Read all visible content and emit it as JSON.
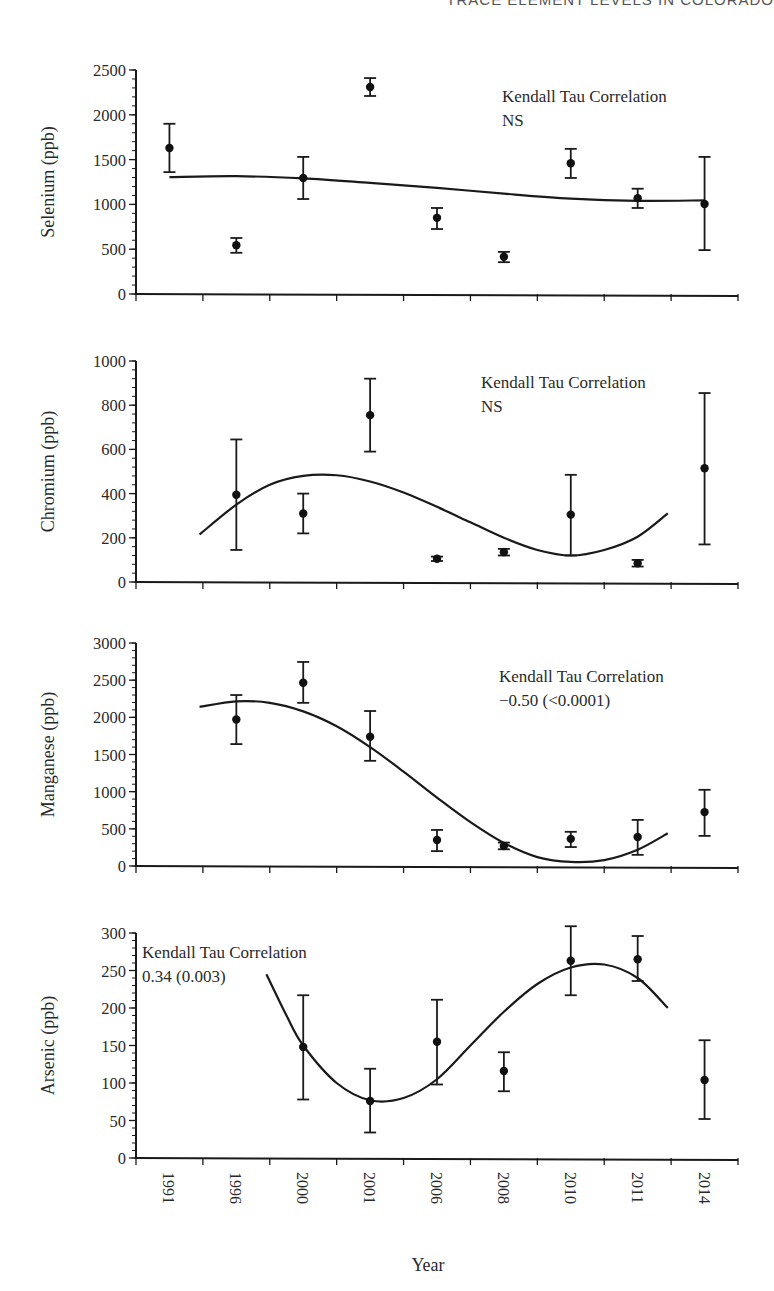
{
  "header": {
    "running_title": "TRACE ELEMENT LEVELS IN COLORADO"
  },
  "figure": {
    "x_axis_title": "Year",
    "x_categories": [
      "1991",
      "1996",
      "2000",
      "2001",
      "2006",
      "2008",
      "2010",
      "2011",
      "2014"
    ]
  },
  "chart_data": [
    {
      "type": "scatter",
      "title": "",
      "xlabel": "Year",
      "ylabel": "Selenium (ppb)",
      "ylim": [
        0,
        2500
      ],
      "yticks": [
        0,
        500,
        1000,
        1500,
        2000,
        2500
      ],
      "categories": [
        "1991",
        "1996",
        "2000",
        "2001",
        "2006",
        "2008",
        "2010",
        "2011",
        "2014"
      ],
      "values": [
        1630,
        545,
        1295,
        2310,
        850,
        415,
        1460,
        1070,
        1005
      ],
      "error_low": [
        1360,
        460,
        1060,
        2210,
        725,
        355,
        1295,
        960,
        490
      ],
      "error_high": [
        1900,
        625,
        1530,
        2410,
        960,
        470,
        1620,
        1175,
        1530
      ],
      "trend_curve": {
        "x_index": [
          0,
          1,
          2,
          3,
          4,
          5,
          6,
          7,
          8
        ],
        "values": [
          1305,
          1315,
          1290,
          1240,
          1185,
          1120,
          1065,
          1040,
          1045
        ]
      },
      "annotation": {
        "line1": "Kendall Tau Correlation",
        "line2": "NS"
      },
      "grid": false,
      "legend": "none"
    },
    {
      "type": "scatter",
      "title": "",
      "xlabel": "Year",
      "ylabel": "Chromium (ppb)",
      "ylim": [
        0,
        1000
      ],
      "yticks": [
        0,
        200,
        400,
        600,
        800,
        1000
      ],
      "categories": [
        "1991",
        "1996",
        "2000",
        "2001",
        "2006",
        "2008",
        "2010",
        "2011",
        "2014"
      ],
      "values": [
        null,
        395,
        310,
        755,
        105,
        135,
        305,
        85,
        515
      ],
      "error_low": [
        null,
        145,
        220,
        590,
        95,
        120,
        120,
        70,
        170
      ],
      "error_high": [
        null,
        645,
        400,
        920,
        115,
        150,
        485,
        100,
        855
      ],
      "trend_curve": {
        "x_index": [
          0.45,
          1,
          1.5,
          2,
          2.5,
          3,
          3.5,
          4,
          4.5,
          5,
          5.5,
          6,
          6.5,
          7,
          7.45
        ],
        "values": [
          215,
          350,
          440,
          480,
          483,
          455,
          405,
          340,
          270,
          200,
          145,
          120,
          145,
          205,
          310
        ]
      },
      "annotation": {
        "line1": "Kendall Tau Correlation",
        "line2": "NS"
      },
      "grid": false,
      "legend": "none"
    },
    {
      "type": "scatter",
      "title": "",
      "xlabel": "Year",
      "ylabel": "Manganese (ppb)",
      "ylim": [
        0,
        3000
      ],
      "yticks": [
        0,
        500,
        1000,
        1500,
        2000,
        2500,
        3000
      ],
      "categories": [
        "1991",
        "1996",
        "2000",
        "2001",
        "2006",
        "2008",
        "2010",
        "2011",
        "2014"
      ],
      "values": [
        null,
        1970,
        2465,
        1740,
        350,
        270,
        365,
        390,
        725
      ],
      "error_low": [
        null,
        1640,
        2195,
        1415,
        200,
        225,
        255,
        150,
        405
      ],
      "error_high": [
        null,
        2300,
        2745,
        2085,
        485,
        315,
        460,
        620,
        1025
      ],
      "trend_curve": {
        "x_index": [
          0.45,
          1,
          1.5,
          2,
          2.5,
          3,
          3.5,
          4,
          4.5,
          5,
          5.5,
          6,
          6.5,
          7,
          7.45
        ],
        "values": [
          2140,
          2215,
          2195,
          2080,
          1880,
          1600,
          1270,
          920,
          590,
          310,
          120,
          55,
          80,
          220,
          440
        ]
      },
      "annotation": {
        "line1": "Kendall Tau Correlation",
        "line2": "−0.50 (<0.0001)"
      },
      "grid": false,
      "legend": "none"
    },
    {
      "type": "scatter",
      "title": "",
      "xlabel": "Year",
      "ylabel": "Arsenic (ppb)",
      "ylim": [
        0,
        300
      ],
      "yticks": [
        0,
        50,
        100,
        150,
        200,
        250,
        300
      ],
      "categories": [
        "1991",
        "1996",
        "2000",
        "2001",
        "2006",
        "2008",
        "2010",
        "2011",
        "2014"
      ],
      "values": [
        null,
        null,
        148,
        76,
        155,
        116,
        263,
        265,
        104
      ],
      "error_low": [
        null,
        null,
        78,
        34,
        98,
        89,
        217,
        236,
        52
      ],
      "error_high": [
        null,
        null,
        217,
        119,
        211,
        141,
        309,
        296,
        157
      ],
      "trend_curve": {
        "x_index": [
          1.45,
          1.75,
          2,
          2.5,
          3,
          3.5,
          4,
          4.5,
          5,
          5.5,
          6,
          6.5,
          7,
          7.45
        ],
        "values": [
          245,
          190,
          150,
          100,
          77,
          80,
          105,
          150,
          195,
          232,
          254,
          258,
          240,
          200
        ]
      },
      "annotation": {
        "line1": "Kendall Tau Correlation",
        "line2": "0.34 (0.003)"
      },
      "grid": false,
      "legend": "none"
    }
  ],
  "layout_hints": {
    "panels": [
      {
        "y_top": 70,
        "y_zero": 294,
        "annot_x": 502,
        "annot_y": 102
      },
      {
        "y_top": 361,
        "y_zero": 582,
        "annot_x": 481,
        "annot_y": 388
      },
      {
        "y_top": 643,
        "y_zero": 866,
        "annot_x": 499,
        "annot_y": 682
      },
      {
        "y_top": 933,
        "y_zero": 1158,
        "annot_x": 142,
        "annot_y": 958
      }
    ],
    "x_left": 136,
    "x_right": 738
  }
}
